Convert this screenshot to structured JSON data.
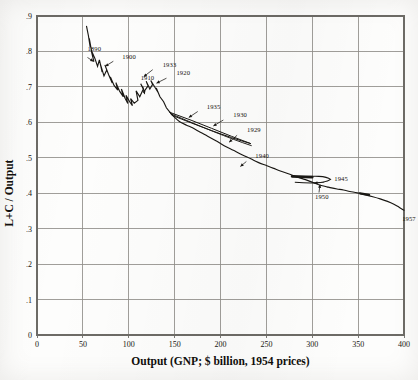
{
  "chart_data": {
    "type": "line",
    "title": "",
    "xlabel": "Output  (GNP; $ billion, 1954 prices)",
    "ylabel": "L+C / Output",
    "xlim": [
      0,
      400
    ],
    "ylim": [
      0,
      0.9
    ],
    "grid": true,
    "legend": "none",
    "xticks": [
      "0",
      "50",
      "100",
      "150",
      "200",
      "250",
      "300",
      "350",
      "400"
    ],
    "xtick_values": [
      0,
      50,
      100,
      150,
      200,
      250,
      300,
      350,
      400
    ],
    "yticks": [
      ".1",
      ".2",
      ".3",
      ".4",
      ".5",
      ".6",
      ".7",
      ".8",
      ".9"
    ],
    "ytick_values": [
      0.1,
      0.2,
      0.3,
      0.4,
      0.5,
      0.6,
      0.7,
      0.8,
      0.9
    ],
    "ytick_zero": "0",
    "series": [
      {
        "name": "L+C/Output vs GNP",
        "x": [
          54,
          56,
          58,
          57,
          60,
          62,
          59,
          63,
          66,
          68,
          71,
          69,
          73,
          76,
          74,
          78,
          82,
          80,
          84,
          88,
          86,
          90,
          94,
          92,
          96,
          99,
          97,
          101,
          104,
          102,
          106,
          110,
          108,
          112,
          116,
          113,
          117,
          121,
          119,
          123,
          126,
          124,
          128,
          132,
          130,
          134,
          138,
          141,
          145,
          150,
          156,
          163,
          170,
          178,
          186,
          195,
          204,
          214,
          224,
          233,
          241,
          250,
          258,
          266,
          274,
          281,
          288,
          294,
          299,
          303,
          307,
          311,
          316,
          321,
          327,
          334,
          341,
          349,
          357,
          366,
          374,
          382,
          389,
          395,
          400
        ],
        "y": [
          0.871,
          0.845,
          0.812,
          0.836,
          0.793,
          0.771,
          0.804,
          0.781,
          0.758,
          0.776,
          0.742,
          0.765,
          0.731,
          0.748,
          0.762,
          0.735,
          0.711,
          0.728,
          0.704,
          0.691,
          0.712,
          0.688,
          0.672,
          0.694,
          0.668,
          0.653,
          0.676,
          0.658,
          0.647,
          0.667,
          0.654,
          0.662,
          0.689,
          0.672,
          0.695,
          0.709,
          0.688,
          0.703,
          0.716,
          0.694,
          0.707,
          0.718,
          0.701,
          0.684,
          0.697,
          0.672,
          0.658,
          0.641,
          0.628,
          0.614,
          0.601,
          0.592,
          0.584,
          0.572,
          0.561,
          0.548,
          0.534,
          0.521,
          0.508,
          0.497,
          0.487,
          0.478,
          0.47,
          0.462,
          0.455,
          0.448,
          0.442,
          0.437,
          0.432,
          0.428,
          0.424,
          0.421,
          0.418,
          0.415,
          0.412,
          0.409,
          0.405,
          0.401,
          0.396,
          0.39,
          0.384,
          0.377,
          0.369,
          0.36,
          0.352
        ]
      }
    ],
    "annotations": [
      {
        "label": "1890",
        "x": 55,
        "y": 0.8
      },
      {
        "label": "1900",
        "x": 93,
        "y": 0.778
      },
      {
        "label": "1910",
        "x": 113,
        "y": 0.719
      },
      {
        "label": "1920",
        "x": 152,
        "y": 0.733
      },
      {
        "label": "1933",
        "x": 137,
        "y": 0.757
      },
      {
        "label": "1935",
        "x": 185,
        "y": 0.639
      },
      {
        "label": "1930",
        "x": 214,
        "y": 0.615
      },
      {
        "label": "1929",
        "x": 229,
        "y": 0.572
      },
      {
        "label": "1940",
        "x": 238,
        "y": 0.498
      },
      {
        "label": "1945",
        "x": 324,
        "y": 0.434
      },
      {
        "label": "1950",
        "x": 303,
        "y": 0.385
      },
      {
        "label": "1957",
        "x": 398,
        "y": 0.322
      }
    ]
  }
}
